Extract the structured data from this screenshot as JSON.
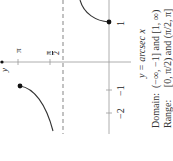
{
  "figure": {
    "orientation": "rotated -90deg",
    "function_label": "y = arcsec x",
    "axis_labels": {
      "y_axis": "y",
      "x_ticks": [
        "1",
        "−1",
        "−2"
      ],
      "y_ticks": [
        "π",
        "π/2"
      ]
    },
    "pi_label": "π",
    "half_pi_num": "π",
    "half_pi_den": "2",
    "tick_1": "1",
    "tick_neg1": "−1",
    "tick_neg2": "−2",
    "caption_func": "y = arcsec x",
    "caption_domain_label": "Domain:",
    "caption_domain_value": "(−∞, −1] and [1, ∞)",
    "caption_range_label": "Range:",
    "caption_range_value": "[0, π/2) and (π/2, π]",
    "colors": {
      "curve": "#333333",
      "axis": "#999999",
      "asymptote": "#9a9a9a"
    }
  }
}
